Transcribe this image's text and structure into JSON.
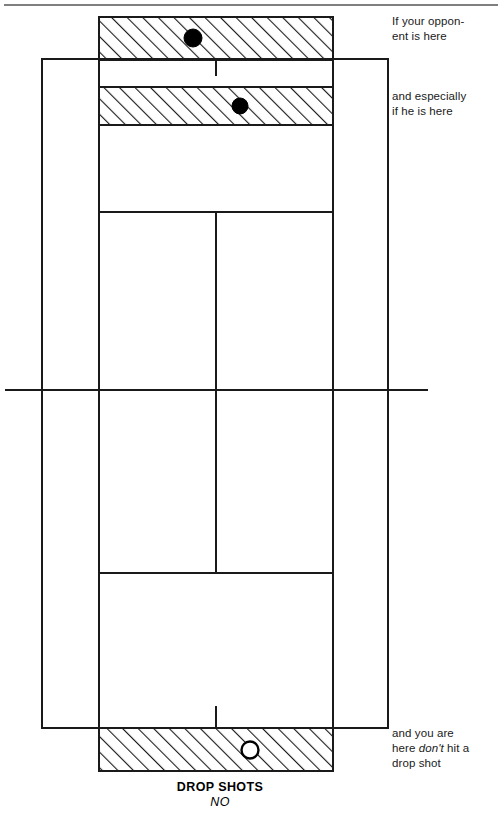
{
  "figure": {
    "type": "tennis-court-diagram",
    "caption_title": "DROP SHOTS",
    "caption_subtitle": "NO",
    "line_color": "#1a1a1a",
    "hatch_color": "#1a1a1a",
    "marker_fill_opponent": "#000000",
    "marker_fill_player": "#ffffff",
    "background": "#ffffff"
  },
  "annotations": {
    "opponent_line1": "If your oppon-",
    "opponent_line2": "ent is here",
    "especially_line1": "and especially",
    "especially_line2": "if he is here",
    "you_line1": "and you are",
    "you_line2_a": "here ",
    "you_line2_em": "don't",
    "you_line2_b": " hit a",
    "you_line3": "drop shot"
  },
  "court": {
    "doubles_left": 42,
    "doubles_right": 388,
    "doubles_top": 59,
    "doubles_bottom": 728,
    "singles_left": 99,
    "singles_right": 333,
    "service_line_top": 212,
    "service_line_bottom": 573,
    "center_service_x": 216,
    "net_y": 390,
    "net_left": 5,
    "net_right": 428
  },
  "zones": [
    {
      "name": "far-baseline-zone",
      "x": 99,
      "y": 17,
      "width": 234,
      "height": 43,
      "hatched": true,
      "marker": {
        "type": "filled-dot",
        "cx": 193,
        "cy": 38,
        "r": 9
      }
    },
    {
      "name": "far-midcourt-zone",
      "x": 99,
      "y": 87,
      "width": 234,
      "height": 38,
      "hatched": true,
      "marker": {
        "type": "filled-dot",
        "cx": 240,
        "cy": 106,
        "r": 8
      }
    },
    {
      "name": "near-baseline-zone",
      "x": 99,
      "y": 728,
      "width": 234,
      "height": 43,
      "hatched": true,
      "marker": {
        "type": "open-dot",
        "cx": 250,
        "cy": 750,
        "r": 8
      }
    }
  ],
  "top_rule": {
    "x1": 4,
    "y1": 5,
    "x2": 498,
    "y2": 5
  }
}
